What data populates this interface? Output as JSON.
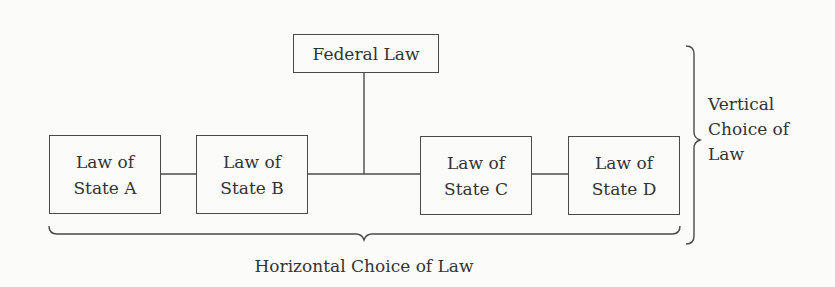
{
  "diagram": {
    "federal": {
      "label": "Federal Law"
    },
    "states": [
      {
        "line1": "Law of",
        "line2": "State A"
      },
      {
        "line1": "Law of",
        "line2": "State B"
      },
      {
        "line1": "Law of",
        "line2": "State C"
      },
      {
        "line1": "Law of",
        "line2": "State D"
      }
    ],
    "vertical_brace_label": {
      "line1": "Vertical",
      "line2": "Choice of",
      "line3": "Law"
    },
    "horizontal_brace_label": "Horizontal Choice of Law",
    "colors": {
      "line": "#4a4a4a",
      "text": "#333333",
      "background": "#fbfbfa"
    }
  }
}
